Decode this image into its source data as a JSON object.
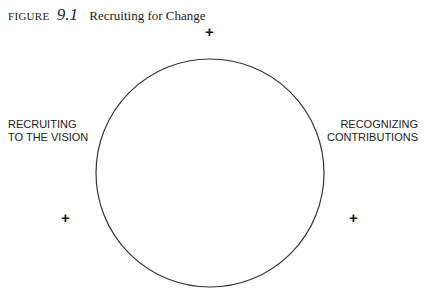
{
  "figure": {
    "prefix": "FIGURE",
    "number": "9.1",
    "title": "Recruiting for Change"
  },
  "diagram": {
    "shape": "circle",
    "stroke_color": "#333333",
    "markers": {
      "top": "+",
      "left": "+",
      "right": "+"
    },
    "labels": {
      "left_line1": "RECRUITING",
      "left_line2": "TO THE VISION",
      "right_line1": "RECOGNIZING",
      "right_line2": "CONTRIBUTIONS"
    }
  }
}
